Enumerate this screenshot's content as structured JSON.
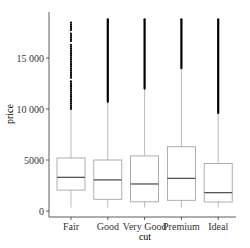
{
  "chart_data": {
    "type": "boxplot",
    "title": "",
    "xlabel": "cut",
    "ylabel": "price",
    "categories": [
      "Fair",
      "Good",
      "Very Good",
      "Premium",
      "Ideal"
    ],
    "yticks": [
      0,
      5000,
      10000,
      15000
    ],
    "ytick_labels": [
      "0",
      "5000",
      "10 000",
      "15 000"
    ],
    "ylim": [
      -400,
      19400
    ],
    "grid": false,
    "legend": null,
    "boxes": [
      {
        "category": "Fair",
        "lower_whisker": 340,
        "q1": 2050,
        "median": 3300,
        "q3": 5200,
        "upper_whisker": 9900,
        "outlier_min": 10000,
        "outlier_max": 18600
      },
      {
        "category": "Good",
        "lower_whisker": 330,
        "q1": 1150,
        "median": 3050,
        "q3": 5000,
        "upper_whisker": 10600,
        "outlier_min": 10700,
        "outlier_max": 18800
      },
      {
        "category": "Very Good",
        "lower_whisker": 340,
        "q1": 900,
        "median": 2650,
        "q3": 5400,
        "upper_whisker": 12000,
        "outlier_min": 12000,
        "outlier_max": 18800
      },
      {
        "category": "Premium",
        "lower_whisker": 330,
        "q1": 1050,
        "median": 3200,
        "q3": 6300,
        "upper_whisker": 14000,
        "outlier_min": 14000,
        "outlier_max": 18800
      },
      {
        "category": "Ideal",
        "lower_whisker": 330,
        "q1": 880,
        "median": 1800,
        "q3": 4650,
        "upper_whisker": 9500,
        "outlier_min": 9600,
        "outlier_max": 18800
      }
    ]
  }
}
